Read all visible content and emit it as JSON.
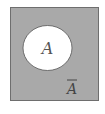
{
  "diagram": {
    "type": "venn",
    "universe": {
      "fill": "#a9a9a9",
      "stroke": "#6e6e6e"
    },
    "set": {
      "label": "A",
      "fill": "#ffffff",
      "stroke": "#555555"
    },
    "complement_label": "A",
    "complement_overline": true
  }
}
